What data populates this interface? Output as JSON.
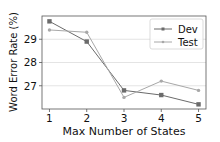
{
  "chart_data": {
    "type": "line",
    "title": "",
    "xlabel": "Max Number of States",
    "ylabel": "Word Error Rate (%)",
    "x": [
      1,
      2,
      3,
      4,
      5
    ],
    "xticks": [
      "1",
      "2",
      "3",
      "4",
      "5"
    ],
    "yticks": [
      27,
      28,
      29
    ],
    "ylim": [
      26.0,
      30.0
    ],
    "xlim": [
      0.8,
      5.2
    ],
    "grid": "horizontal",
    "legend_position": "upper right",
    "series": [
      {
        "name": "Dev",
        "values": [
          29.77,
          28.9,
          26.8,
          26.6,
          26.2
        ],
        "color": "#6b6b6b",
        "marker": "square"
      },
      {
        "name": "Test",
        "values": [
          29.4,
          29.3,
          26.5,
          27.2,
          26.8
        ],
        "color": "#a8a8a8",
        "marker": "circle"
      }
    ]
  },
  "legend": {
    "dev": "Dev",
    "test": "Test"
  },
  "axes": {
    "xlabel": "Max Number of States",
    "ylabel": "Word Error Rate (%)"
  }
}
